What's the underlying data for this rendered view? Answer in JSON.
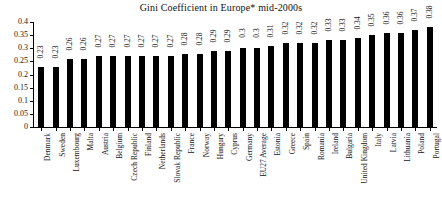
{
  "chart_data": {
    "type": "bar",
    "title": "Gini Coefficient in Europe* mid-2000s",
    "xlabel": "",
    "ylabel": "",
    "ylim": [
      0,
      0.4
    ],
    "yticks": [
      "0",
      "0.05",
      "0.1",
      "0.15",
      "0.2",
      "0.25",
      "0.3",
      "0.35",
      "0.4"
    ],
    "ytick_values": [
      0,
      0.05,
      0.1,
      0.15,
      0.2,
      0.25,
      0.3,
      0.35,
      0.4
    ],
    "grid": false,
    "legend": null,
    "bar_color": "#000000",
    "background_color": "#ffffff",
    "value_labels_rotated": true,
    "category_labels_rotated": true,
    "categories": [
      "Denmark",
      "Sweden",
      "Luxembourg",
      "Malta",
      "Austria",
      "Belgium",
      "Czech Republic",
      "Finland",
      "Netherlands",
      "Slovak Republic",
      "France",
      "Norway",
      "Hungary",
      "Cyprus",
      "Germany",
      "EU27 Average",
      "Estonia",
      "Greece",
      "Spain",
      "Romania",
      "Ireland",
      "Bulgaria",
      "United Kingdom",
      "Italy",
      "Latvia",
      "Lithuania",
      "Poland",
      "Portugal"
    ],
    "values": [
      0.23,
      0.23,
      0.26,
      0.26,
      0.27,
      0.27,
      0.27,
      0.27,
      0.27,
      0.27,
      0.28,
      0.28,
      0.29,
      0.29,
      0.3,
      0.3,
      0.31,
      0.32,
      0.32,
      0.32,
      0.33,
      0.33,
      0.34,
      0.35,
      0.36,
      0.36,
      0.37,
      0.38
    ],
    "value_labels": [
      "0.23",
      "0.23",
      "0.26",
      "0.26",
      "0.27",
      "0.27",
      "0.27",
      "0.27",
      "0.27",
      "0.27",
      "0.28",
      "0.28",
      "0.29",
      "0.29",
      "0.3",
      "0.3",
      "0.31",
      "0.32",
      "0.32",
      "0.32",
      "0.33",
      "0.33",
      "0.34",
      "0.35",
      "0.36",
      "0.36",
      "0.37",
      "0.38"
    ]
  }
}
